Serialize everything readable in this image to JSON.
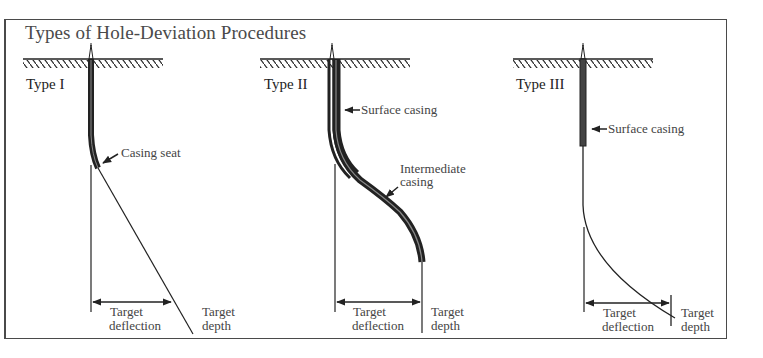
{
  "figure": {
    "title": "Types of Hole-Deviation Procedures",
    "panels": [
      {
        "type_label": "Type I",
        "annotations": {
          "casing": "Casing seat",
          "deflection_line1": "Target",
          "deflection_line2": "deflection",
          "depth_line1": "Target",
          "depth_line2": "depth"
        }
      },
      {
        "type_label": "Type II",
        "annotations": {
          "surface_casing": "Surface casing",
          "intermediate_line1": "Intermediate",
          "intermediate_line2": "casing",
          "deflection_line1": "Target",
          "deflection_line2": "deflection",
          "depth_line1": "Target",
          "depth_line2": "depth"
        }
      },
      {
        "type_label": "Type III",
        "annotations": {
          "surface_casing": "Surface casing",
          "deflection_line1": "Target",
          "deflection_line2": "deflection",
          "depth_line1": "Target",
          "depth_line2": "depth"
        }
      }
    ],
    "icons": [
      "derrick-icon",
      "ground-hatch-icon",
      "arrow-left-icon",
      "dimension-arrow-icon"
    ],
    "colors": {
      "ink": "#222222",
      "frame": "#4a4a4a",
      "background": "#ffffff"
    }
  }
}
